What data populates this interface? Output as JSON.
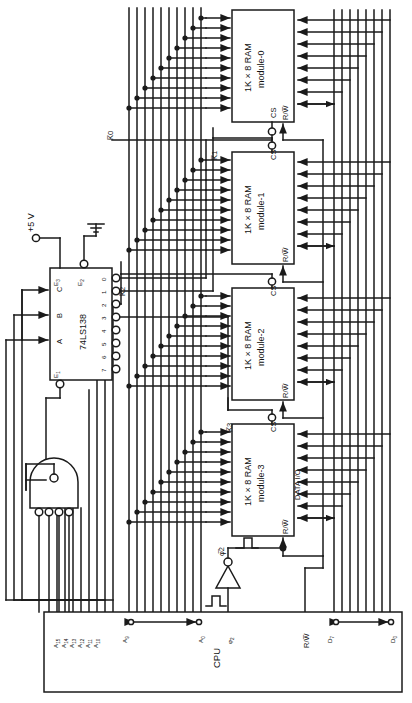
{
  "figure": {
    "background": "#ffffff",
    "line_color": "#1a1a1a"
  },
  "cpu": {
    "name": "CPU",
    "pins": {
      "addr_high": [
        "A15",
        "A14",
        "A13",
        "A12",
        "A11",
        "A10"
      ],
      "addr_low_hi": "A9",
      "addr_low_lo": "A0",
      "clock": "φ2",
      "rw": "R/W̅",
      "data_hi": "D7",
      "data_lo": "D0"
    }
  },
  "decoder": {
    "part": "74LS138",
    "inputs": [
      "A",
      "B",
      "C"
    ],
    "enables": [
      "E1",
      "E2",
      "E3"
    ],
    "outputs": [
      "0",
      "1",
      "2",
      "3",
      "4",
      "5",
      "6",
      "7"
    ],
    "supply_label": "+5 V"
  },
  "nand_gate": {
    "name": "4-input NAND",
    "inputs": 4
  },
  "inverter": {
    "name": "clock inverter",
    "output_label": "φ̅2"
  },
  "ram_modules": [
    {
      "line1": "1K × 8 RAM",
      "line2": "module-0",
      "cs": "CS",
      "rw": "R/W̅",
      "select": "K̅0"
    },
    {
      "line1": "1K × 8 RAM",
      "line2": "module-1",
      "cs": "CS",
      "rw": "R/W̅",
      "select": "K̅1"
    },
    {
      "line1": "1K × 8 RAM",
      "line2": "module-2",
      "cs": "CS",
      "rw": "R/W̅",
      "select": "K̅2"
    },
    {
      "line1": "1K × 8 RAM",
      "line2": "module-3",
      "cs": "CS",
      "rw": "R/W̅",
      "select": "K̅3",
      "data_io": "DATA I/O"
    }
  ]
}
